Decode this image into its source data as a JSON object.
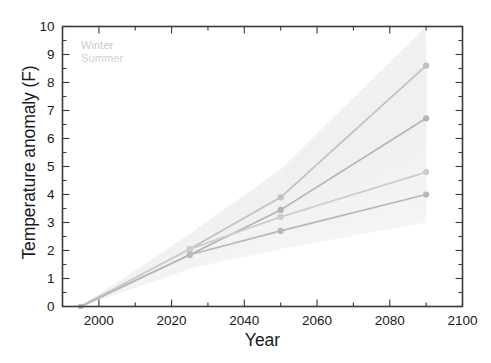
{
  "chart_data": {
    "type": "line",
    "title": "",
    "xlabel": "Year",
    "ylabel": "Temperature anomaly (F)",
    "xlim": [
      1990,
      2100
    ],
    "ylim": [
      0,
      10
    ],
    "grid": false,
    "legend_position": "upper left",
    "x_major_ticks": [
      2000,
      2020,
      2040,
      2060,
      2080,
      2100
    ],
    "x_tick_labels": [
      "2000",
      "2020",
      "2040",
      "2060",
      "2080",
      "2100"
    ],
    "x_minor_tick_interval": 10,
    "y_major_ticks": [
      0,
      1,
      2,
      3,
      4,
      5,
      6,
      7,
      8,
      9,
      10
    ],
    "y_tick_labels": [
      "0",
      "1",
      "2",
      "3",
      "4",
      "5",
      "6",
      "7",
      "8",
      "9",
      "10"
    ],
    "y_minor_tick_interval": 0.5,
    "legend_entries": [
      {
        "label": "Winter",
        "color": "#c9c9c9"
      },
      {
        "label": "Summer",
        "color": "#d2d2d2"
      }
    ],
    "x": [
      1995,
      2025,
      2050,
      2090
    ],
    "series": [
      {
        "name": "Winter high",
        "color": "#c0c0c0",
        "band_color": "#efefef",
        "values": [
          0.0,
          2.05,
          3.9,
          8.6
        ],
        "band_low": [
          0.0,
          1.5,
          2.9,
          6.6
        ],
        "band_high": [
          0.0,
          2.6,
          4.9,
          10.0
        ]
      },
      {
        "name": "Summer high",
        "color": "#b4b4b4",
        "band_color": "#f0f0f0",
        "values": [
          0.0,
          1.85,
          3.45,
          6.72
        ],
        "band_low": [
          0.0,
          1.35,
          2.6,
          5.2
        ],
        "band_high": [
          0.0,
          2.35,
          4.3,
          8.3
        ]
      },
      {
        "name": "Winter low",
        "color": "#cdcdcd",
        "band_color": "#f2f2f2",
        "values": [
          0.0,
          2.05,
          3.2,
          4.8
        ],
        "band_low": [
          0.0,
          1.5,
          2.5,
          3.5
        ],
        "band_high": [
          0.0,
          2.6,
          3.95,
          6.1
        ]
      },
      {
        "name": "Summer low",
        "color": "#b8b8b8",
        "band_color": "#f3f3f3",
        "values": [
          0.0,
          1.85,
          2.7,
          4.0
        ],
        "band_low": [
          0.0,
          1.35,
          2.05,
          3.0
        ],
        "band_high": [
          0.0,
          2.35,
          3.35,
          5.1
        ]
      }
    ]
  },
  "axes": {
    "y_title": "Temperature anomaly (F)",
    "x_title": "Year"
  },
  "legend": {
    "winter_label": "Winter",
    "summer_label": "Summer"
  },
  "colors": {
    "axis": "#3a3a3a",
    "text": "#1a1a1a",
    "background": "#ffffff"
  }
}
